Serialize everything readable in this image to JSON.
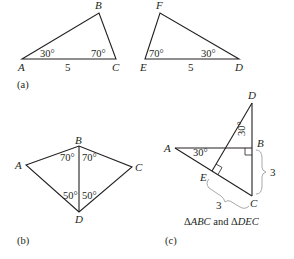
{
  "figure": {
    "panels": [
      {
        "id": "a",
        "caption": "(a)",
        "triangles": [
          {
            "name": "ABC",
            "vertices": {
              "A": "A",
              "B": "B",
              "C": "C"
            },
            "angles": {
              "A": "30°",
              "C": "70°"
            },
            "side_AC": "5"
          },
          {
            "name": "DEF",
            "vertices": {
              "E": "E",
              "F": "F",
              "D": "D"
            },
            "angles": {
              "E": "70°",
              "D": "30°"
            },
            "side_ED": "5"
          }
        ]
      },
      {
        "id": "b",
        "caption": "(b)",
        "vertices": {
          "A": "A",
          "B": "B",
          "C": "C",
          "D": "D"
        },
        "angles": {
          "ABD": "70°",
          "CBD": "70°",
          "ADB": "50°",
          "CDB": "50°"
        }
      },
      {
        "id": "c",
        "caption": "(c)",
        "subtitle_prefix": "Δ",
        "subtitle_t1": "ABC",
        "subtitle_mid": " and Δ",
        "subtitle_t2": "DEC",
        "vertices": {
          "A": "A",
          "B": "B",
          "C": "C",
          "D": "D",
          "E": "E"
        },
        "angles": {
          "A": "30°",
          "D": "30°"
        },
        "brace_BC": "3",
        "brace_EC": "3"
      }
    ]
  }
}
